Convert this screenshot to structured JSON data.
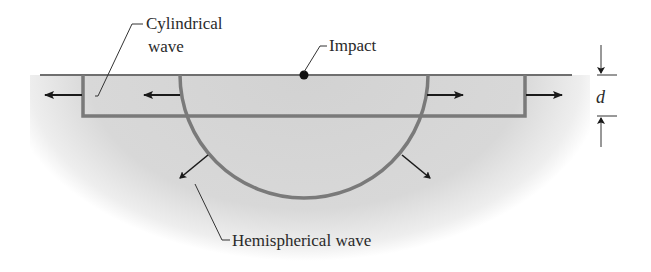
{
  "diagram": {
    "labels": {
      "cylindrical_line1": "Cylindrical",
      "cylindrical_line2": "wave",
      "impact": "Impact",
      "depth": "d",
      "hemispherical": "Hemispherical wave"
    },
    "colors": {
      "ground_fill": "#d6d6d6",
      "wave_line": "#7a7a7a",
      "arrow": "#1a1a1a",
      "text": "#2a2a2a",
      "background": "#ffffff"
    }
  }
}
